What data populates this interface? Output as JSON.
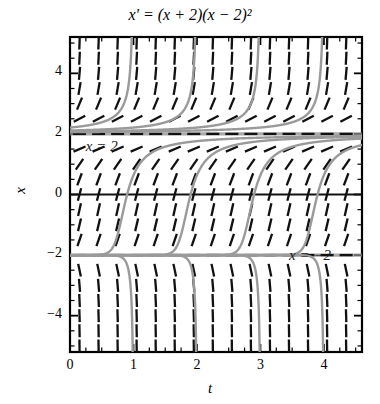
{
  "figure": {
    "title": "x' = (x + 2)(x − 2)²",
    "type": "slope-field"
  },
  "axes": {
    "x_label": "t",
    "y_label": "x",
    "x_ticks": [
      "0",
      "1",
      "2",
      "3",
      "4"
    ],
    "y_ticks": [
      "4",
      "2",
      "0",
      "−2",
      "−4"
    ],
    "x_range": [
      0,
      4.6
    ],
    "y_range": [
      -5.2,
      5.2
    ]
  },
  "annotations": [
    {
      "id": "eq-upper",
      "text": "x = 2",
      "x": 0.25,
      "y": 1.55
    },
    {
      "id": "eq-lower",
      "text": "x = −2",
      "x": 3.45,
      "y": -2.05
    }
  ],
  "chart_data": {
    "type": "line",
    "title": "x' = (x + 2)(x − 2)²",
    "xlabel": "t",
    "ylabel": "x",
    "xlim": [
      0,
      4.6
    ],
    "ylim": [
      -5.2,
      5.2
    ],
    "grid": false,
    "legend": null,
    "equation": "x' = (x + 2)(x - 2)^2",
    "equilibria": [
      {
        "value": 2,
        "stability": "semistable",
        "label": "x = 2"
      },
      {
        "value": -2,
        "stability": "unstable",
        "label": "x = -2"
      }
    ],
    "slope_field": {
      "description": "dashed tick marks with slope dx/dt = (x+2)(x-2)^2",
      "t_samples": [
        0.15,
        0.45,
        0.75,
        1.05,
        1.35,
        1.65,
        1.95,
        2.25,
        2.55,
        2.85,
        3.15,
        3.45,
        3.75,
        4.05,
        4.35
      ],
      "x_samples": [
        -5.0,
        -4.5,
        -4.0,
        -3.5,
        -3.0,
        -2.5,
        -2.0,
        -1.5,
        -1.0,
        -0.5,
        0.0,
        0.5,
        1.0,
        1.5,
        2.0,
        2.5,
        3.0,
        3.5,
        4.0,
        4.5,
        5.0
      ]
    },
    "solution_curves": [
      {
        "name": "below-asymptote-1",
        "t_cross_0": 0.9
      },
      {
        "name": "below-asymptote-2",
        "t_cross_0": 1.9
      },
      {
        "name": "below-asymptote-3",
        "t_cross_0": 2.9
      },
      {
        "name": "below-asymptote-4",
        "t_cross_0": 3.9
      },
      {
        "name": "above-2-curve-1",
        "t_asymptote": 1.15
      },
      {
        "name": "above-2-curve-2",
        "t_asymptote": 2.15
      },
      {
        "name": "above-2-curve-3",
        "t_asymptote": 3.15
      },
      {
        "name": "above-2-curve-4",
        "t_asymptote": 4.15
      }
    ]
  },
  "colors": {
    "ink": "#111111",
    "curve": "#9a9a9a",
    "equilibrium": "#8c8c8c",
    "frame": "#000000"
  }
}
